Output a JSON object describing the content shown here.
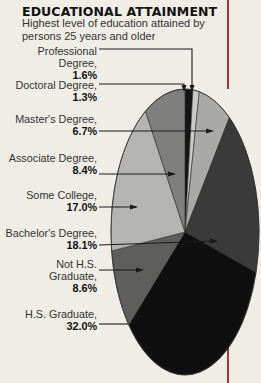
{
  "header": {
    "title": "EDUCATIONAL ATTAINMENT",
    "subtitle": "Highest level of education attained by persons 25 years and older"
  },
  "colors": {
    "background": "#efede6",
    "accent_rule": "#9b3a48"
  },
  "labels": [
    {
      "line1": "Professional",
      "line2": "Degree,",
      "value": "1.6%"
    },
    {
      "line1": "Doctoral Degree,",
      "line2": "",
      "value": "1.3%"
    },
    {
      "line1": "Master's Degree,",
      "line2": "",
      "value": "6.7%"
    },
    {
      "line1": "Associate Degree,",
      "line2": "",
      "value": "8.4%"
    },
    {
      "line1": "Some College,",
      "line2": "",
      "value": "17.0%"
    },
    {
      "line1": "Bachelor's Degree,",
      "line2": "",
      "value": "18.1%"
    },
    {
      "line1": "Not H.S.",
      "line2": "Graduate,",
      "value": "8.6%"
    },
    {
      "line1": "H.S. Graduate,",
      "line2": "",
      "value": "32.0%"
    }
  ],
  "chart_data": {
    "type": "pie",
    "title": "EDUCATIONAL ATTAINMENT",
    "subtitle": "Highest level of education attained by persons 25 years and older",
    "slice_order": "clockwise from top",
    "categories": [
      "Professional Degree",
      "Doctoral Degree",
      "Master's Degree",
      "Bachelor's Degree",
      "H.S. Graduate",
      "Not H.S. Graduate",
      "Some College",
      "Associate Degree"
    ],
    "values": [
      1.6,
      1.3,
      6.7,
      18.1,
      32.0,
      8.6,
      17.0,
      8.4
    ],
    "unit": "%",
    "slice_colors": [
      "#141414",
      "#c9c9c6",
      "#a9a9a6",
      "#3a3a3a",
      "#0f0f0f",
      "#5e5e5c",
      "#b4b4b1",
      "#7f7f7d"
    ],
    "legend": "callout labels on left with arrows"
  }
}
